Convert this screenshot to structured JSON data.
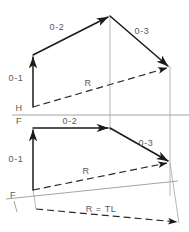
{
  "drawing": {
    "title": "Descriptive geometry vector diagram",
    "labels": {
      "top_0_2": "0-2",
      "top_0_3": "0-3",
      "top_0_1": "0-1",
      "top_R": "R",
      "fold_H": "H",
      "fold_F": "F",
      "front_0_2": "0-2",
      "front_0_3": "0-3",
      "front_0_1": "0-1",
      "front_R": "R",
      "aux_fold_F": "F",
      "aux_R_TL": "R = TL"
    },
    "colors": {
      "solid_line": "#1a1a1a",
      "dashed_line": "#2b2b2b",
      "reference_line": "#9a9a9a",
      "projection_line": "#a5a5a5",
      "label_text": "#5a5a5a",
      "background": "#ffffff"
    },
    "geometry": {
      "top_view": {
        "origin_0": [
          33,
          107
        ],
        "point_1": [
          33,
          55
        ],
        "point_2": [
          110,
          16
        ],
        "point_3": [
          170,
          68
        ],
        "resultant": "0 to 3 dashed"
      },
      "front_view": {
        "origin_0": [
          33,
          190
        ],
        "point_1": [
          33,
          128
        ],
        "point_2": [
          110,
          128
        ],
        "point_3": [
          170,
          163
        ],
        "resultant": "0 to 3 dashed"
      },
      "fold_line_HF_y": 115,
      "aux_fold_line": [
        [
          8,
          198
        ],
        [
          175,
          181
        ]
      ],
      "aux_true_length": [
        [
          36,
          208
        ],
        [
          178,
          223
        ]
      ]
    }
  }
}
